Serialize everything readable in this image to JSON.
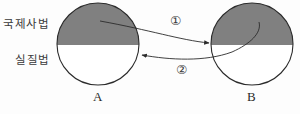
{
  "diagram": {
    "background_color": "#fdfdfd",
    "shaded_color": "#808080",
    "unshaded_color": "#ffffff",
    "stroke_color": "#2b2b2b",
    "regions": {
      "upper_label": "국제사법",
      "lower_label": "실질법"
    },
    "circles": [
      {
        "id": "A",
        "label": "A",
        "cx": 98,
        "cy": 44,
        "r": 41,
        "divider_y": 45
      },
      {
        "id": "B",
        "label": "B",
        "cx": 252,
        "cy": 44,
        "r": 41,
        "divider_y": 45
      }
    ],
    "arrows": [
      {
        "id": "arrow-1",
        "label": "①",
        "from": "A-upper",
        "to": "B-upper",
        "direction": "left-to-right"
      },
      {
        "id": "arrow-2",
        "label": "②",
        "from": "B-upper",
        "to": "A-lower",
        "direction": "right-to-left"
      }
    ]
  }
}
